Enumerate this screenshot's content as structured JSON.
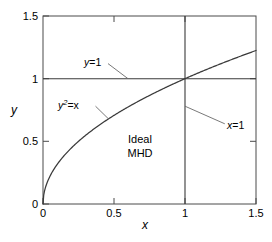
{
  "chart_data": {
    "type": "line",
    "title": "",
    "xlabel": "x",
    "ylabel": "y",
    "xlim": [
      0,
      1.5
    ],
    "ylim": [
      0,
      1.5
    ],
    "grid": false,
    "legend": "none",
    "xticks": [
      "0",
      "0.5",
      "1",
      "1.5"
    ],
    "xtick_values": [
      0,
      0.5,
      1,
      1.5
    ],
    "yticks": [
      "0",
      "0.5",
      "1",
      "1.5"
    ],
    "ytick_values": [
      0,
      0.5,
      1,
      1.5
    ],
    "series": [
      {
        "name": "y^2=x",
        "kind": "curve",
        "equation": "y = sqrt(x)",
        "x": [
          0,
          0.05,
          0.1,
          0.15,
          0.2,
          0.25,
          0.3,
          0.35,
          0.4,
          0.45,
          0.5,
          0.6,
          0.7,
          0.8,
          0.9,
          1.0,
          1.1,
          1.2,
          1.3,
          1.4,
          1.5
        ],
        "values": [
          0,
          0.2236,
          0.3162,
          0.3873,
          0.4472,
          0.5,
          0.5477,
          0.5916,
          0.6325,
          0.6708,
          0.7071,
          0.7746,
          0.8367,
          0.8944,
          0.9487,
          1.0,
          1.0488,
          1.0954,
          1.1402,
          1.1832,
          1.2247
        ]
      },
      {
        "name": "y=1",
        "kind": "hline",
        "y": 1.0,
        "x": [
          0,
          1.5
        ],
        "values": [
          1.0,
          1.0
        ]
      },
      {
        "name": "x=1",
        "kind": "vline",
        "x_value": 1.0,
        "x": [
          1.0,
          1.0
        ],
        "values": [
          0,
          1.5
        ]
      }
    ],
    "annotations": [
      {
        "id": "y-equals-1",
        "text_plain": "y=1",
        "var": "y",
        "rest": "=1",
        "leader_from": [
          0.46,
          1.17
        ],
        "leader_to": [
          0.6,
          1.0
        ]
      },
      {
        "id": "y2-equals-x",
        "text_plain": "y2=x",
        "var": "y",
        "sup": "2",
        "rest": "=x",
        "leader_from": [
          0.37,
          0.78
        ],
        "leader_to": [
          0.46,
          0.68
        ]
      },
      {
        "id": "x-equals-1",
        "text_plain": "x=1",
        "var": "x",
        "rest": "=1",
        "leader_from": [
          1.28,
          0.64
        ],
        "leader_to": [
          1.0,
          0.78
        ]
      },
      {
        "id": "region",
        "line1": "Ideal",
        "line2": "MHD",
        "at": [
          0.68,
          0.48
        ]
      }
    ],
    "colors": {
      "curve": "#3a3a3a",
      "axis": "#4a4a4a",
      "leader": "#6a6a6a",
      "text": "#000000",
      "background": "#ffffff"
    }
  },
  "labels": {
    "x_axis_title": "x",
    "y_axis_title": "y",
    "xtick_0": "0",
    "xtick_1": "0.5",
    "xtick_2": "1",
    "xtick_3": "1.5",
    "ytick_0": "0",
    "ytick_1": "0.5",
    "ytick_2": "1",
    "ytick_3": "1.5",
    "annot_y1_var": "y",
    "annot_y1_rest": "=1",
    "annot_y2x_var": "y",
    "annot_y2x_sup": "2",
    "annot_y2x_rest": "=x",
    "annot_x1_var": "x",
    "annot_x1_rest": "=1",
    "region_line1": "Ideal",
    "region_line2": "MHD"
  }
}
